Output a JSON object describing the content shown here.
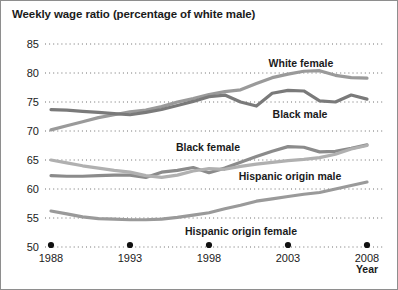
{
  "chart_data": {
    "type": "line",
    "title": "Weekly wage ratio (percentage of white male)",
    "xlabel": "Year",
    "ylabel": "",
    "xlim": [
      1988,
      2008
    ],
    "ylim": [
      50,
      85
    ],
    "ytick_labels": [
      "50",
      "55",
      "60",
      "65",
      "70",
      "75",
      "80",
      "85"
    ],
    "yticks": [
      50,
      55,
      60,
      65,
      70,
      75,
      80,
      85
    ],
    "xtick_labels": [
      "1988",
      "1993",
      "1998",
      "2003",
      "2008"
    ],
    "xticks": [
      1988,
      1993,
      1998,
      2003,
      2008
    ],
    "grid": "horizontal-dotted",
    "legend": "inline-labels",
    "x": [
      1988,
      1989,
      1990,
      1991,
      1992,
      1993,
      1994,
      1995,
      1996,
      1997,
      1998,
      1999,
      2000,
      2001,
      2002,
      2003,
      2004,
      2005,
      2006,
      2007,
      2008
    ],
    "series": [
      {
        "name": "White female",
        "color": "#9a9a9a",
        "values": [
          70.2,
          70.9,
          71.6,
          72.3,
          72.8,
          73.3,
          73.6,
          74.2,
          75.0,
          75.6,
          76.3,
          76.8,
          77.1,
          78.2,
          79.2,
          79.8,
          80.3,
          80.4,
          79.6,
          79.2,
          79.1
        ]
      },
      {
        "name": "Black male",
        "color": "#7a7a7a",
        "values": [
          73.7,
          73.6,
          73.4,
          73.2,
          73.0,
          72.8,
          73.2,
          73.7,
          74.4,
          75.1,
          75.9,
          76.2,
          75.0,
          74.3,
          76.5,
          77.0,
          76.9,
          75.2,
          75.0,
          76.2,
          75.5
        ]
      },
      {
        "name": "Black female",
        "color": "#8b8b8b",
        "values": [
          62.3,
          62.2,
          62.2,
          62.3,
          62.4,
          62.4,
          62.0,
          62.9,
          63.2,
          63.7,
          62.8,
          63.6,
          64.6,
          65.6,
          66.5,
          67.3,
          67.2,
          66.4,
          66.5,
          67.0,
          67.6
        ]
      },
      {
        "name": "Hispanic origin male",
        "color": "#b0b0b0",
        "values": [
          65.0,
          64.5,
          64.0,
          63.6,
          63.2,
          62.9,
          62.3,
          62.0,
          62.4,
          63.1,
          63.5,
          63.4,
          63.9,
          64.3,
          64.6,
          64.9,
          65.1,
          65.4,
          66.0,
          66.9,
          67.5
        ]
      },
      {
        "name": "Hispanic origin female",
        "color": "#9a9a9a",
        "values": [
          56.2,
          55.7,
          55.2,
          54.9,
          54.8,
          54.7,
          54.7,
          54.8,
          55.1,
          55.5,
          55.9,
          56.6,
          57.2,
          57.9,
          58.3,
          58.7,
          59.1,
          59.4,
          60.0,
          60.6,
          61.2
        ]
      }
    ],
    "series_labels": [
      {
        "text": "White female",
        "x": 300,
        "y": 66
      },
      {
        "text": "Black male",
        "x": 299,
        "y": 117
      },
      {
        "text": "Black female",
        "x": 207,
        "y": 150
      },
      {
        "text": "Hispanic origin male",
        "x": 289,
        "y": 179
      },
      {
        "text": "Hispanic origin female",
        "x": 240,
        "y": 234
      }
    ]
  }
}
